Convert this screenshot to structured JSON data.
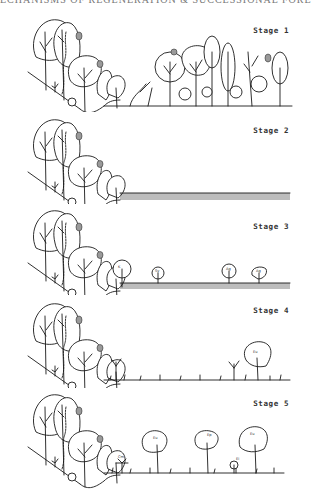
{
  "header": {
    "title": "ECHANISMS OF REGENERATION & SUCCESSIONAL FORESTS"
  },
  "figure": {
    "stages": [
      {
        "label": "Stage 1",
        "ground": "forest",
        "species_tags": []
      },
      {
        "label": "Stage 2",
        "ground": "cleared / hatched grass",
        "species_tags": []
      },
      {
        "label": "Stage 3",
        "ground": "hatched grass with scattered young trees",
        "species_tags": [
          "K",
          "Sy",
          "Ag",
          "Ag"
        ]
      },
      {
        "label": "Stage 4",
        "ground": "sparse grass with pioneer trees",
        "species_tags": [
          "Eu"
        ]
      },
      {
        "label": "Stage 5",
        "ground": "grass with established trees",
        "species_tags": [
          "Cm",
          "Eu",
          "Ep",
          "Ei",
          "Eu"
        ]
      }
    ]
  }
}
